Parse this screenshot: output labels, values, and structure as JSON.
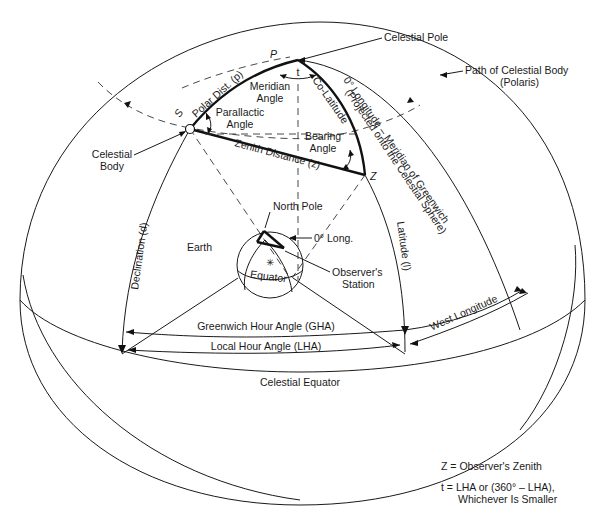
{
  "figure": {
    "colors": {
      "ink": "#1a1a1a",
      "background": "#ffffff"
    }
  },
  "labels": {
    "celestial_pole": "Celestial Pole",
    "pole_letter": "P",
    "path_of_body_line1": "Path of Celestial Body",
    "path_of_body_line2": "(Polaris)",
    "meridian_line1": "0° Longitude – Meridian of Greenwich",
    "meridian_line2": "(Projected onto the Celestial Sphere)",
    "t_symbol": "t",
    "meridian_angle_line1": "Meridian",
    "meridian_angle_line2": "Angle",
    "polar_distance": "Polar Dist. (p)",
    "body_letter": "S",
    "parallactic_line1": "Parallactic",
    "parallactic_line2": "Angle",
    "co_latitude": "Co-Latitude",
    "bearing_line1": "Bearing",
    "bearing_line2": "Angle",
    "zenith_distance": "Zenith Distance (z)",
    "zenith_letter": "Z",
    "celestial_body_line1": "Celestial",
    "celestial_body_line2": "Body",
    "north_pole": "North Pole",
    "zero_long": "0° Long.",
    "earth": "Earth",
    "equator": "Equator",
    "observers_station_line1": "Observer's",
    "observers_station_line2": "Station",
    "declination": "Declination (d)",
    "latitude": "Latitude (l)",
    "west_longitude": "West Longitude",
    "gha": "Greenwich Hour Angle (GHA)",
    "lha": "Local Hour Angle (LHA)",
    "celestial_equator": "Celestial Equator"
  },
  "legend": {
    "z_def": "Z = Observer's Zenith",
    "t_def_line1": "t  = LHA or (360° – LHA),",
    "t_def_line2": "Whichever Is Smaller"
  }
}
